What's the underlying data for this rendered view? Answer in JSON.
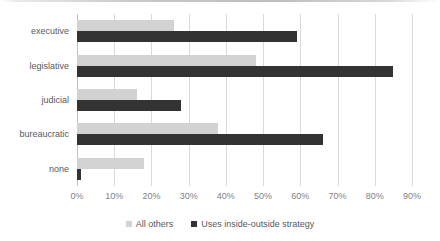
{
  "chart_data": {
    "type": "bar",
    "orientation": "horizontal",
    "title": "",
    "xlabel": "",
    "ylabel": "",
    "categories": [
      "executive",
      "legislative",
      "judicial",
      "bureaucratic",
      "none"
    ],
    "series": [
      {
        "name": "All others",
        "color": "#d2d2d2",
        "values": [
          26,
          48,
          16,
          38,
          18
        ]
      },
      {
        "name": "Uses inside-outside strategy",
        "color": "#333333",
        "values": [
          59,
          85,
          28,
          66,
          1
        ]
      }
    ],
    "xlim": [
      0,
      90
    ],
    "xtick_values": [
      0,
      10,
      20,
      30,
      40,
      50,
      60,
      70,
      80,
      90
    ],
    "xtick_labels": [
      "0%",
      "10%",
      "20%",
      "30%",
      "40%",
      "50%",
      "60%",
      "70%",
      "80%",
      "90%"
    ],
    "value_unit": "%",
    "grid": "vertical",
    "legend_position": "bottom",
    "gridline_color": "#d9d9d9",
    "axis_color": "#bfbfbf",
    "label_color": "#595959",
    "tick_color": "#7f7f7f",
    "background": "#ffffff"
  }
}
